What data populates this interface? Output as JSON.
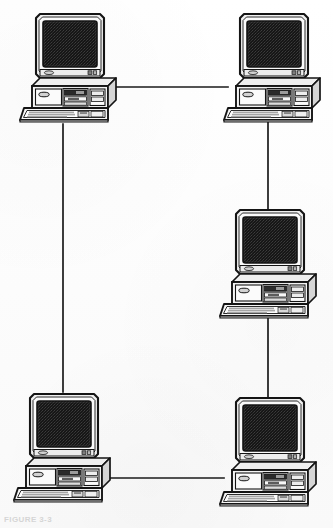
{
  "document": {
    "type": "scanned-figure",
    "title": "Network topology diagram",
    "description": "Five desktop personal computers connected by cable links forming a ring-style network layout",
    "figure_caption": "FIGURE 3-3",
    "page_background": "#fdfdfd",
    "ink_color": "#1a1a1a",
    "screen_color": "#141414",
    "case_fill": "#f2f2f2",
    "case_shade": "#d8d8d8",
    "case_shade_dark": "#bfbfbf"
  },
  "diagram": {
    "type": "network-topology",
    "canvas": {
      "width": 333,
      "height": 528
    },
    "node_count": 5,
    "link_count": 5,
    "nodes": [
      {
        "id": "pc-top-left",
        "label": "Workstation top-left",
        "x": 18,
        "y": 12,
        "scale": 1.0
      },
      {
        "id": "pc-top-right",
        "label": "Workstation top-right",
        "x": 222,
        "y": 12,
        "scale": 1.0
      },
      {
        "id": "pc-middle-right",
        "label": "Workstation middle-right",
        "x": 218,
        "y": 208,
        "scale": 1.0
      },
      {
        "id": "pc-bottom-left",
        "label": "Workstation bottom-left",
        "x": 12,
        "y": 392,
        "scale": 1.0
      },
      {
        "id": "pc-bottom-right",
        "label": "Workstation bottom-right",
        "x": 218,
        "y": 396,
        "scale": 1.0
      }
    ],
    "links": [
      {
        "id": "link-top",
        "from": "pc-top-left",
        "to": "pc-top-right",
        "orientation": "horizontal",
        "x1": 110,
        "y1": 87,
        "x2": 228,
        "y2": 87
      },
      {
        "id": "link-left",
        "from": "pc-top-left",
        "to": "pc-bottom-left",
        "orientation": "vertical",
        "x1": 63,
        "y1": 124,
        "x2": 63,
        "y2": 392
      },
      {
        "id": "link-right-upper",
        "from": "pc-top-right",
        "to": "pc-middle-right",
        "orientation": "vertical",
        "x1": 268,
        "y1": 122,
        "x2": 268,
        "y2": 211
      },
      {
        "id": "link-right-lower",
        "from": "pc-middle-right",
        "to": "pc-bottom-right",
        "orientation": "vertical",
        "x1": 268,
        "y1": 318,
        "x2": 268,
        "y2": 398
      },
      {
        "id": "link-bottom",
        "from": "pc-bottom-left",
        "to": "pc-bottom-right",
        "orientation": "horizontal",
        "x1": 104,
        "y1": 478,
        "x2": 224,
        "y2": 478
      }
    ],
    "computer_parts": {
      "monitor": "CRT display with light bezel and dark screen",
      "screen": "dark dithered raster screen",
      "case": "horizontal desktop chassis",
      "drive_bay": "floppy / optical drive bays",
      "power_indicator": "oval panel badge",
      "keyboard": "flat keyboard with key rows"
    }
  }
}
